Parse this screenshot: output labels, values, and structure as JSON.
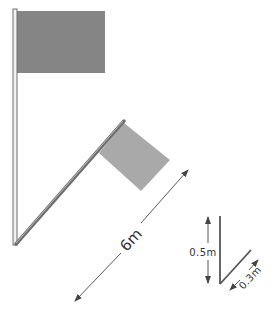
{
  "figure": {
    "colors": {
      "background": "#ffffff",
      "upright_flag": "#858585",
      "tilted_flag": "#a9a9a9",
      "pole_fill": "#f2f2f2",
      "pole_outline": "#6e6e6e",
      "dimension_line": "#444444"
    }
  },
  "labels": {
    "pole_length": "6m",
    "inset_height": "0.5m",
    "inset_length": "0.3m"
  }
}
